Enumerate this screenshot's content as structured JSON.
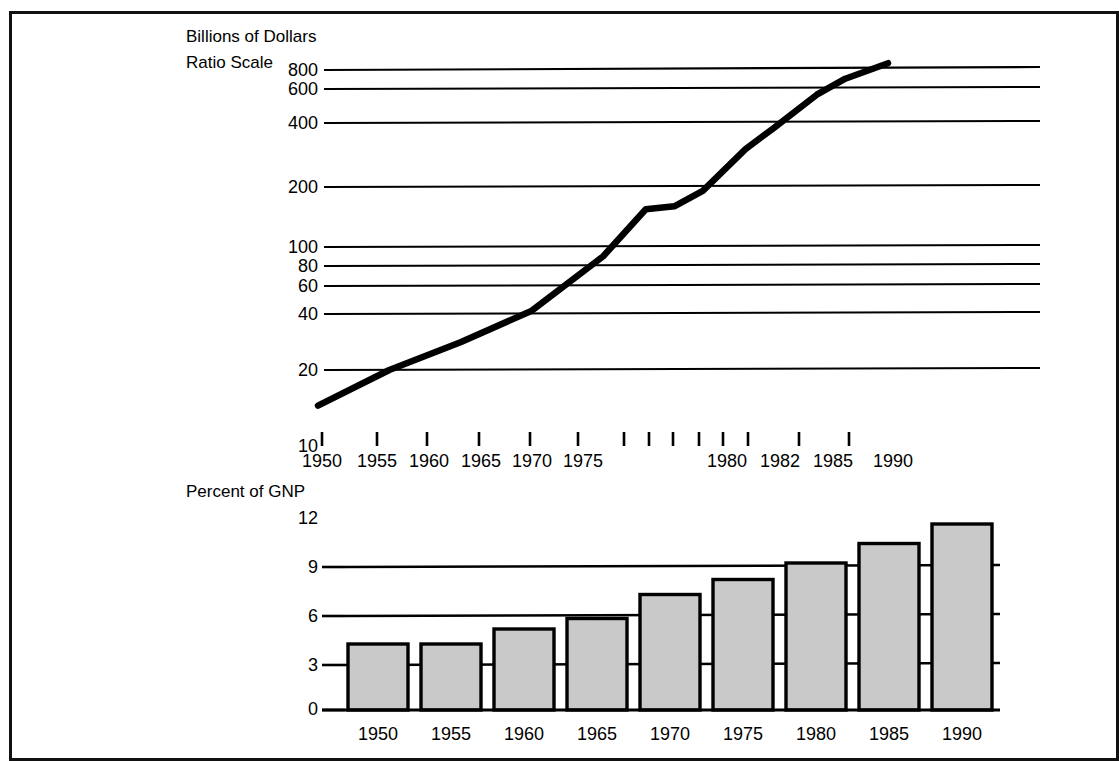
{
  "figure": {
    "frame_visible": true,
    "background_color": "#ffffff",
    "ink_color": "#000000",
    "bar_fill_color": "#c9c9c9"
  },
  "chart_data": [
    {
      "type": "line",
      "title": "",
      "ylabel_lines": [
        "Billions of Dollars",
        "Ratio Scale"
      ],
      "xlabel": "",
      "yscale": "log",
      "ylim": [
        10,
        900
      ],
      "grid": true,
      "legend_position": "none",
      "ytick_labels": [
        "800",
        "600",
        "400",
        "200",
        "100",
        "80",
        "60",
        "40",
        "20",
        "10"
      ],
      "ytick_values": [
        800,
        600,
        400,
        200,
        100,
        80,
        60,
        40,
        20,
        10
      ],
      "gridline_values": [
        600,
        400,
        200,
        100,
        80,
        60,
        40,
        20
      ],
      "xtick_labels": [
        "1950",
        "1955",
        "1960",
        "1965",
        "1970",
        "1975",
        "1980",
        "1982",
        "1985",
        "1990"
      ],
      "xtick_unlabeled_count": 4,
      "x": [
        1950,
        1955,
        1960,
        1965,
        1970,
        1973,
        1975,
        1977,
        1980,
        1982,
        1985,
        1987,
        1990
      ],
      "values": [
        13,
        20,
        28,
        41,
        79,
        140,
        145,
        175,
        290,
        375,
        560,
        680,
        820
      ]
    },
    {
      "type": "bar",
      "title": "",
      "ylabel_lines": [
        "Percent of GNP"
      ],
      "xlabel": "",
      "yscale": "linear",
      "ylim": [
        0,
        13.2
      ],
      "grid": true,
      "legend_position": "none",
      "ytick_labels": [
        "12",
        "9",
        "6",
        "3",
        "0"
      ],
      "ytick_values": [
        12,
        9,
        6,
        3,
        0
      ],
      "gridline_values": [
        9,
        6,
        3
      ],
      "categories": [
        "1950",
        "1955",
        "1960",
        "1965",
        "1970",
        "1975",
        "1980",
        "1985",
        "1990"
      ],
      "values": [
        4.4,
        4.4,
        5.4,
        6.1,
        7.7,
        8.7,
        9.8,
        11.1,
        12.4
      ]
    }
  ]
}
